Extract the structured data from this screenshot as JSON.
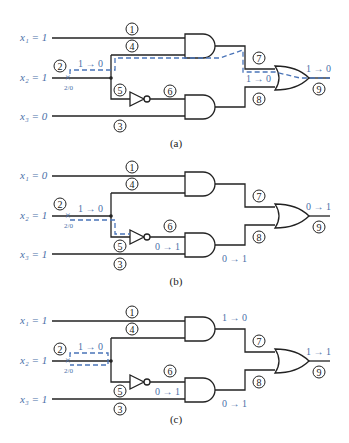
{
  "figure": {
    "path_color": "#4a74b8",
    "label_color": "#4a6fa8",
    "wire_color": "#222222",
    "panels": [
      {
        "caption": "(a)",
        "inputs": {
          "x1": "x₁ = 1",
          "x2": "x₂ = 1",
          "x3": "x₃ = 0"
        },
        "fault_label": "2/0",
        "transition_line2": "1 → 0",
        "transition_line7": "1 → 0",
        "transition_out": "1 → 0",
        "transition_line6": "",
        "transition_line8": ""
      },
      {
        "caption": "(b)",
        "inputs": {
          "x1": "x₁ = 0",
          "x2": "x₂ = 1",
          "x3": "x₃ = 1"
        },
        "fault_label": "2/0",
        "transition_line2": "1 → 0",
        "transition_line6": "0 → 1",
        "transition_line8": "0 → 1",
        "transition_out": "0 → 1",
        "transition_line7": ""
      },
      {
        "caption": "(c)",
        "inputs": {
          "x1": "x₁ = 1",
          "x2": "x₂ = 1",
          "x3": "x₃ = 1"
        },
        "fault_label": "2/0",
        "transition_line2": "1 → 0",
        "transition_line6": "0 → 1",
        "transition_line7": "1 → 0",
        "transition_line8": "0 → 1",
        "transition_out": "1 → 1"
      }
    ],
    "line_numbers": [
      "1",
      "2",
      "3",
      "4",
      "5",
      "6",
      "7",
      "8",
      "9"
    ]
  }
}
